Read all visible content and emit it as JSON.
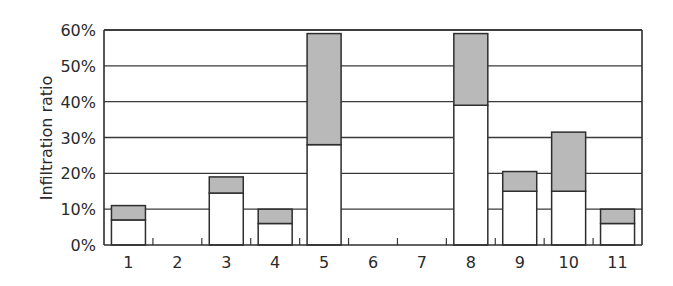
{
  "chart_data": {
    "type": "bar",
    "stacked": true,
    "title": "",
    "xlabel": "",
    "ylabel": "Infiltration ratio",
    "ylim": [
      0,
      60
    ],
    "yticks": [
      "0%",
      "10%",
      "20%",
      "30%",
      "40%",
      "50%",
      "60%"
    ],
    "grid": true,
    "legend": null,
    "categories": [
      "1",
      "2",
      "3",
      "4",
      "5",
      "6",
      "7",
      "8",
      "9",
      "10",
      "11"
    ],
    "series": [
      {
        "name": "lower (white)",
        "color": "#ffffff",
        "values": [
          7,
          0,
          14.5,
          6,
          28,
          0,
          0,
          39,
          15,
          15,
          6
        ]
      },
      {
        "name": "upper (gray)",
        "color": "#b9b9b9",
        "values": [
          4,
          0,
          4.5,
          4,
          31,
          0,
          0,
          20,
          5.5,
          16.5,
          4
        ]
      }
    ],
    "totals": [
      11,
      0,
      19,
      10,
      59,
      0,
      0,
      59,
      20.5,
      31.5,
      10
    ]
  }
}
